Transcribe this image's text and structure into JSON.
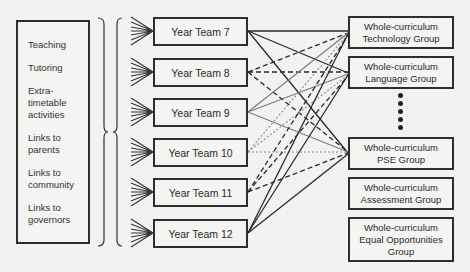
{
  "activities": [
    {
      "label": "Teaching"
    },
    {
      "label": "Tutoring"
    },
    {
      "label": "Extra-\ntimetable\nactivities"
    },
    {
      "label": "Links to\nparents"
    },
    {
      "label": "Links to\ncommunity"
    },
    {
      "label": "Links to\ngovernors"
    }
  ],
  "year_teams": [
    {
      "label": "Year Team 7"
    },
    {
      "label": "Year Team 8"
    },
    {
      "label": "Year Team 9"
    },
    {
      "label": "Year Team 10"
    },
    {
      "label": "Year Team 11"
    },
    {
      "label": "Year Team 12"
    }
  ],
  "curriculum_groups": [
    {
      "label": "Whole-curriculum\nTechnology Group"
    },
    {
      "label": "Whole-curriculum\nLanguage Group"
    },
    {
      "label": "Whole-curriculum\nPSE Group"
    },
    {
      "label": "Whole-curriculum\nAssessment Group"
    },
    {
      "label": "Whole-curriculum\nEqual Opportunities\nGroup"
    }
  ],
  "ellipsis": {
    "symbol": "vertical-dots",
    "count": 5
  },
  "connections": [
    {
      "from": "Year Team 7",
      "to": "Whole-curriculum Technology Group",
      "style": "solid-dark"
    },
    {
      "from": "Year Team 7",
      "to": "Whole-curriculum Language Group",
      "style": "solid-dark"
    },
    {
      "from": "Year Team 7",
      "to": "Whole-curriculum PSE Group",
      "style": "solid-dark"
    },
    {
      "from": "Year Team 8",
      "to": "Whole-curriculum Technology Group",
      "style": "dashed"
    },
    {
      "from": "Year Team 8",
      "to": "Whole-curriculum Language Group",
      "style": "dashed"
    },
    {
      "from": "Year Team 8",
      "to": "Whole-curriculum PSE Group",
      "style": "dashed"
    },
    {
      "from": "Year Team 9",
      "to": "Whole-curriculum Technology Group",
      "style": "solid-gray"
    },
    {
      "from": "Year Team 9",
      "to": "Whole-curriculum Language Group",
      "style": "solid-gray"
    },
    {
      "from": "Year Team 9",
      "to": "Whole-curriculum PSE Group",
      "style": "solid-gray"
    },
    {
      "from": "Year Team 10",
      "to": "Whole-curriculum Technology Group",
      "style": "dotted"
    },
    {
      "from": "Year Team 10",
      "to": "Whole-curriculum Language Group",
      "style": "dotted"
    },
    {
      "from": "Year Team 10",
      "to": "Whole-curriculum PSE Group",
      "style": "dotted"
    },
    {
      "from": "Year Team 11",
      "to": "Whole-curriculum Technology Group",
      "style": "dashed"
    },
    {
      "from": "Year Team 11",
      "to": "Whole-curriculum Language Group",
      "style": "dashed"
    },
    {
      "from": "Year Team 11",
      "to": "Whole-curriculum PSE Group",
      "style": "dashed"
    },
    {
      "from": "Year Team 12",
      "to": "Whole-curriculum Technology Group",
      "style": "solid-dark"
    },
    {
      "from": "Year Team 12",
      "to": "Whole-curriculum Language Group",
      "style": "solid-dark"
    },
    {
      "from": "Year Team 12",
      "to": "Whole-curriculum PSE Group",
      "style": "solid-dark"
    }
  ],
  "colors": {
    "background": "#f2f2f0",
    "box_border": "#2e2e2e",
    "line_dark": "#2a2a2a",
    "line_gray": "#7a7a7a",
    "line_dotted": "#8a8a8a"
  }
}
